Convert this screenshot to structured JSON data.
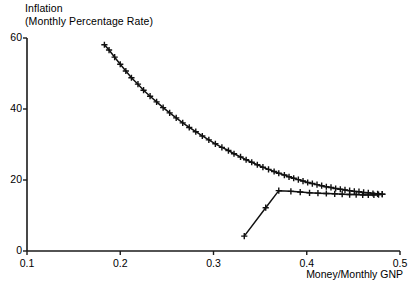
{
  "chart_data": {
    "type": "line",
    "ylabel_line1": "Inflation",
    "ylabel_line2": "(Monthly Percentage Rate)",
    "xlabel": "Money/Monthly GNP",
    "xlim": [
      0.1,
      0.5
    ],
    "ylim": [
      0,
      60
    ],
    "xticks": [
      0.1,
      0.2,
      0.3,
      0.4,
      0.5
    ],
    "xtick_labels": [
      "0.1",
      "0.2",
      "0.3",
      "0.4",
      "0.5"
    ],
    "yticks": [
      0,
      20,
      40,
      60
    ],
    "ytick_labels": [
      "0",
      "20",
      "40",
      "60"
    ],
    "grid": false,
    "legend": null,
    "marker": "plus",
    "series": [
      {
        "name": "upper-branch",
        "x": [
          0.183,
          0.188,
          0.194,
          0.2,
          0.206,
          0.212,
          0.219,
          0.225,
          0.232,
          0.239,
          0.246,
          0.253,
          0.26,
          0.267,
          0.274,
          0.281,
          0.288,
          0.295,
          0.302,
          0.309,
          0.316,
          0.322,
          0.329,
          0.335,
          0.341,
          0.347,
          0.353,
          0.359,
          0.365,
          0.37,
          0.376,
          0.381,
          0.386,
          0.391,
          0.396,
          0.401,
          0.406,
          0.411,
          0.416,
          0.421,
          0.426,
          0.431,
          0.436,
          0.441,
          0.446,
          0.451,
          0.456,
          0.461,
          0.466,
          0.471,
          0.476,
          0.481
        ],
        "y": [
          58.1,
          56.6,
          54.6,
          52.6,
          50.7,
          48.8,
          47.0,
          45.3,
          43.6,
          42.0,
          40.4,
          38.9,
          37.5,
          36.1,
          34.8,
          33.6,
          32.4,
          31.3,
          30.2,
          29.2,
          28.3,
          27.4,
          26.5,
          25.7,
          25.0,
          24.3,
          23.6,
          23.0,
          22.4,
          21.9,
          21.4,
          20.9,
          20.5,
          20.1,
          19.7,
          19.3,
          19.0,
          18.7,
          18.4,
          18.1,
          17.9,
          17.6,
          17.4,
          17.2,
          17.0,
          16.8,
          16.7,
          16.5,
          16.4,
          16.2,
          16.1,
          16.0
        ]
      },
      {
        "name": "lower-branch",
        "x": [
          0.333,
          0.356,
          0.37,
          0.383,
          0.393,
          0.403,
          0.412,
          0.421,
          0.43,
          0.438,
          0.446,
          0.453,
          0.46,
          0.466,
          0.472,
          0.477,
          0.481
        ],
        "y": [
          4.2,
          12.2,
          17.0,
          16.8,
          16.6,
          16.4,
          16.3,
          16.2,
          16.1,
          16.0,
          15.9,
          15.9,
          15.8,
          15.8,
          15.8,
          15.9,
          16.0
        ]
      }
    ]
  }
}
